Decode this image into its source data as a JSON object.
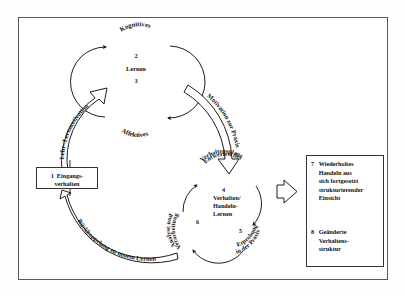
{
  "diagram": {
    "title_visible": false,
    "language": "de",
    "background_color": "#ffffff",
    "line_color": "#111111",
    "frame_color": "#5a5a5a"
  },
  "cycle_top": {
    "center_line1": "2",
    "center_line2": "Lernen",
    "center_line3": "3",
    "arc_label_top": "Kognitives",
    "arc_label_bottom": "Affektives"
  },
  "cycle_bottom": {
    "center_line1": "Verhalten/",
    "center_line2": "Handeln-",
    "center_line3": "Lernen",
    "arc_label_top": "Entwerfen des",
    "arc_label_top2": "Verhaltensplans",
    "arc_label_right": "Erprobung",
    "arc_label_right2": "in der Praxis",
    "arc_label_left": "Analyse und",
    "arc_label_left2": "Verarbeitung",
    "num_4": "4",
    "num_5": "5",
    "num_6": "6"
  },
  "arrows": {
    "motivation": "Motivation zur Praxis",
    "lehr_lern": "Lehr-/Lernmotivation",
    "rueckkoppelung": "Rückkoppelung zu neuem Lernen"
  },
  "boxes": {
    "box1": {
      "number": "1",
      "line1": "Eingangs-",
      "line2": "verhalten"
    },
    "box7": {
      "number": "7",
      "line1": "Wiederholtes",
      "line2": "Handeln aus",
      "line3": "sich fortgesetzt",
      "line4": "strukturierender",
      "line5": "Einsicht"
    },
    "box8": {
      "number": "8",
      "line1": "Geänderte",
      "line2": "Verhaltens-",
      "line3": "struktur"
    }
  }
}
